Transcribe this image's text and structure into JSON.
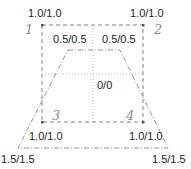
{
  "diagram": {
    "colors": {
      "rect_line": "#777777",
      "trap_line": "#888888",
      "cross_line": "#aaaaaa",
      "label_text": "#222222",
      "corner_number": "#8a8a8a"
    },
    "corner_numbers": [
      "1",
      "2",
      "3",
      "4"
    ],
    "labels": {
      "top_left_outer": "1.0/1.0",
      "top_right_outer": "1.0/1.0",
      "top_left_inner": "0.5/0.5",
      "top_right_inner": "0.5/0.5",
      "center": "0/0",
      "bottom_left_inner": "1.0/1.0",
      "bottom_right_inner": "1.0/1.0",
      "bottom_left_outer": "1.5/1.5",
      "bottom_right_outer": "1.5/1.5"
    }
  }
}
